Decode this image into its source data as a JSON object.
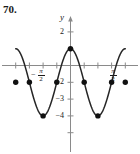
{
  "problem": {
    "number": "70."
  },
  "axes": {
    "y_axis_label": "y",
    "y_ticks": [
      {
        "value": 2,
        "label": "2"
      },
      {
        "value": -2,
        "label": "−2"
      },
      {
        "value": -3,
        "label": "−3"
      },
      {
        "value": -4,
        "label": "−4"
      }
    ],
    "x_ticks_labeled": [
      {
        "value": -1.5708,
        "numerator": "π",
        "denominator": "2",
        "negative": true,
        "label": "−π/2"
      },
      {
        "value": 1.5708,
        "numerator": "π",
        "denominator": "2",
        "negative": false,
        "label": "π/2"
      }
    ],
    "xlim": [
      -3.6,
      3.6
    ],
    "ylim": [
      -4.8,
      2.6
    ],
    "x_tick_spacing": "pi/4",
    "y_tick_spacing": 1,
    "grid": false,
    "arrows": [
      "x-right",
      "x-left",
      "y-up",
      "y-down"
    ]
  },
  "chart_data": {
    "type": "line",
    "title": "",
    "xlabel": "",
    "ylabel": "y",
    "xlim": [
      -3.6,
      3.6
    ],
    "ylim": [
      -4.8,
      2.6
    ],
    "grid": false,
    "legend": "none",
    "function": "y = 2cos(2x) − 1",
    "series": [
      {
        "name": "y = 2cos(2x) - 1",
        "x": [
          -3.1416,
          -2.7489,
          -2.3562,
          -1.9635,
          -1.5708,
          -1.1781,
          -0.7854,
          -0.3927,
          0,
          0.3927,
          0.7854,
          1.1781,
          1.5708,
          1.9635,
          2.3562,
          2.7489,
          3.1416
        ],
        "y": [
          1,
          0.41,
          -1,
          -2.41,
          -3,
          -2.41,
          -1,
          0.41,
          1,
          0.41,
          -1,
          -2.41,
          -3,
          -2.41,
          -1,
          0.41,
          1
        ]
      }
    ],
    "marked_points": [
      {
        "x": -3.1416,
        "y": -1,
        "note": "left endpoint dot"
      },
      {
        "x": -2.3562,
        "y": -1,
        "note": "dot at -3pi/4"
      },
      {
        "x": -1.5708,
        "y": -3,
        "note": "minimum at -pi/2"
      },
      {
        "x": -0.7854,
        "y": -1,
        "note": "dot at -pi/4"
      },
      {
        "x": 0,
        "y": 1,
        "note": "maximum at 0"
      },
      {
        "x": 0.7854,
        "y": -1,
        "note": "dot at pi/4"
      },
      {
        "x": 1.5708,
        "y": -3,
        "note": "minimum at pi/2"
      },
      {
        "x": 2.3562,
        "y": -1,
        "note": "dot at 3pi/4"
      },
      {
        "x": 3.1416,
        "y": -1,
        "note": "right endpoint dot"
      }
    ],
    "colors": {
      "curve": "#262626",
      "axis": "#808080",
      "point": "#111111"
    }
  }
}
